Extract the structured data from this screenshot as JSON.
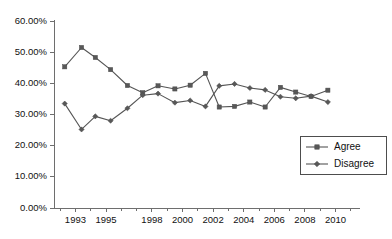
{
  "chart_data": {
    "type": "line",
    "title": "",
    "xlabel": "",
    "ylabel": "",
    "ylim": [
      0,
      60
    ],
    "xlim": [
      1991.6,
      2011.6
    ],
    "grid": false,
    "y_tick_labels": [
      "0.00%",
      "10.00%",
      "20.00%",
      "30.00%",
      "40.00%",
      "50.00%",
      "60.00%"
    ],
    "y_tick_values": [
      0,
      10,
      20,
      30,
      40,
      50,
      60
    ],
    "x_tick_labels": [
      "1993",
      "1995",
      "1998",
      "2000",
      "2002",
      "2004",
      "2006",
      "2008",
      "2010"
    ],
    "x_tick_values": [
      1993,
      1995,
      1998,
      2000,
      2002,
      2004,
      2006,
      2008,
      2010
    ],
    "x": [
      1992.3,
      1993.4,
      1994.3,
      1995.3,
      1996.3,
      1997.4,
      1998.4,
      1999.4,
      2000.4,
      2001.4,
      2002.4,
      2003.3,
      2004.3,
      2005.3,
      2006.3,
      2007.3,
      2008.3,
      2009.3,
      2010.4
    ],
    "legend_position": "bottom-right",
    "series": [
      {
        "name": "Agree",
        "marker": "square",
        "color": "#585858",
        "values": [
          45.3,
          51.5,
          48.3,
          44.4,
          39.3,
          37.0,
          39.2,
          38.2,
          39.4,
          43.2,
          32.4,
          32.6,
          34.0,
          32.4,
          38.7,
          37.2,
          35.8,
          37.8,
          null
        ]
      },
      {
        "name": "Disagree",
        "marker": "diamond",
        "color": "#585858",
        "values": [
          33.5,
          25.2,
          29.4,
          28.0,
          32.0,
          36.2,
          36.7,
          33.8,
          34.5,
          32.6,
          39.2,
          39.8,
          38.5,
          37.9,
          35.7,
          35.2,
          35.9,
          34.0,
          null
        ]
      }
    ],
    "series_points": {
      "Agree": [
        {
          "x": 1992.3,
          "y": 45.3
        },
        {
          "x": 1993.4,
          "y": 51.5
        },
        {
          "x": 1994.3,
          "y": 48.3
        },
        {
          "x": 1995.3,
          "y": 44.4
        },
        {
          "x": 1996.4,
          "y": 39.3
        },
        {
          "x": 1997.4,
          "y": 37.0
        },
        {
          "x": 1998.4,
          "y": 39.2
        },
        {
          "x": 1999.5,
          "y": 38.2
        },
        {
          "x": 2000.5,
          "y": 39.4
        },
        {
          "x": 2001.5,
          "y": 43.2
        },
        {
          "x": 2002.4,
          "y": 32.4
        },
        {
          "x": 2003.4,
          "y": 32.6
        },
        {
          "x": 2004.4,
          "y": 34.0
        },
        {
          "x": 2005.4,
          "y": 32.4
        },
        {
          "x": 2006.4,
          "y": 38.7
        },
        {
          "x": 2007.4,
          "y": 37.2
        },
        {
          "x": 2008.4,
          "y": 35.8
        },
        {
          "x": 2009.5,
          "y": 37.8
        }
      ],
      "Disagree": [
        {
          "x": 1992.3,
          "y": 33.5
        },
        {
          "x": 1993.4,
          "y": 25.2
        },
        {
          "x": 1994.3,
          "y": 29.4
        },
        {
          "x": 1995.3,
          "y": 28.0
        },
        {
          "x": 1996.4,
          "y": 32.0
        },
        {
          "x": 1997.4,
          "y": 36.2
        },
        {
          "x": 1998.4,
          "y": 36.7
        },
        {
          "x": 1999.5,
          "y": 33.8
        },
        {
          "x": 2000.5,
          "y": 34.5
        },
        {
          "x": 2001.5,
          "y": 32.6
        },
        {
          "x": 2002.4,
          "y": 39.2
        },
        {
          "x": 2003.4,
          "y": 39.8
        },
        {
          "x": 2004.4,
          "y": 38.5
        },
        {
          "x": 2005.4,
          "y": 37.9
        },
        {
          "x": 2006.4,
          "y": 35.7
        },
        {
          "x": 2007.4,
          "y": 35.2
        },
        {
          "x": 2008.4,
          "y": 35.9
        },
        {
          "x": 2009.5,
          "y": 34.0
        }
      ]
    },
    "legend": [
      {
        "label": "Agree",
        "marker": "square",
        "color": "#585858"
      },
      {
        "label": "Disagree",
        "marker": "diamond",
        "color": "#585858"
      }
    ]
  },
  "colors": {
    "background": "#ffffff",
    "axis": "#6e6e6e",
    "series": "#585858",
    "text": "#111111"
  }
}
